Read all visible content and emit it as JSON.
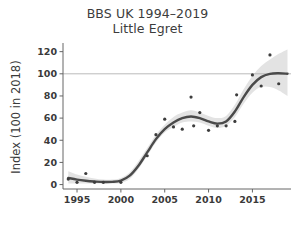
{
  "chart_data": {
    "type": "scatter",
    "title": "BBS UK 1994–2019",
    "subtitle": "Little Egret",
    "xlabel": "",
    "ylabel": "Index (100 in 2018)",
    "xlim": [
      1993.4,
      2019.4
    ],
    "ylim": [
      -4,
      126
    ],
    "xticks": [
      1995,
      2000,
      2005,
      2010,
      2015
    ],
    "xtick_labels": [
      "1995",
      "2000",
      "2005",
      "2010",
      "2015"
    ],
    "yticks": [
      0,
      20,
      40,
      60,
      80,
      100,
      120
    ],
    "ytick_labels": [
      "0",
      "20",
      "40",
      "60",
      "80",
      "100",
      "120"
    ],
    "grid": false,
    "reference_line": {
      "y": 100,
      "color": "#aaaaaa"
    },
    "legend": null,
    "series": [
      {
        "name": "annual index",
        "type": "scatter",
        "marker_color": "#3d3d3d",
        "points": [
          {
            "x": 1994,
            "y": 5
          },
          {
            "x": 1995,
            "y": 2
          },
          {
            "x": 1996,
            "y": 10
          },
          {
            "x": 1997,
            "y": 2
          },
          {
            "x": 1998,
            "y": 2
          },
          {
            "x": 2000,
            "y": 2
          },
          {
            "x": 2003,
            "y": 26
          },
          {
            "x": 2004,
            "y": 45
          },
          {
            "x": 2005,
            "y": 59
          },
          {
            "x": 2006,
            "y": 52
          },
          {
            "x": 2007,
            "y": 50
          },
          {
            "x": 2008,
            "y": 79
          },
          {
            "x": 2008.3,
            "y": 53
          },
          {
            "x": 2009,
            "y": 65
          },
          {
            "x": 2010,
            "y": 49
          },
          {
            "x": 2011,
            "y": 53
          },
          {
            "x": 2012,
            "y": 53
          },
          {
            "x": 2013,
            "y": 57
          },
          {
            "x": 2013.2,
            "y": 81
          },
          {
            "x": 2015,
            "y": 99
          },
          {
            "x": 2016,
            "y": 89
          },
          {
            "x": 2017,
            "y": 117
          },
          {
            "x": 2018,
            "y": 91
          }
        ]
      },
      {
        "name": "smoothed trend",
        "type": "line",
        "line_color": "#4a4a4a",
        "points": [
          {
            "x": 1994,
            "y": 6
          },
          {
            "x": 1995,
            "y": 4.5
          },
          {
            "x": 1996,
            "y": 3.5
          },
          {
            "x": 1997,
            "y": 2.8
          },
          {
            "x": 1998,
            "y": 2.3
          },
          {
            "x": 1999,
            "y": 2.4
          },
          {
            "x": 2000,
            "y": 3.5
          },
          {
            "x": 2001,
            "y": 8
          },
          {
            "x": 2002,
            "y": 17
          },
          {
            "x": 2003,
            "y": 29
          },
          {
            "x": 2004,
            "y": 41
          },
          {
            "x": 2005,
            "y": 50
          },
          {
            "x": 2006,
            "y": 56
          },
          {
            "x": 2007,
            "y": 60
          },
          {
            "x": 2008,
            "y": 61.5
          },
          {
            "x": 2009,
            "y": 60
          },
          {
            "x": 2010,
            "y": 57
          },
          {
            "x": 2011,
            "y": 55
          },
          {
            "x": 2012,
            "y": 57
          },
          {
            "x": 2013,
            "y": 66
          },
          {
            "x": 2014,
            "y": 79
          },
          {
            "x": 2015,
            "y": 90
          },
          {
            "x": 2016,
            "y": 97
          },
          {
            "x": 2017,
            "y": 100
          },
          {
            "x": 2018,
            "y": 100.5
          },
          {
            "x": 2019,
            "y": 100
          }
        ]
      },
      {
        "name": "confidence band",
        "type": "area",
        "fill_color": "#e2e2e2",
        "lower": [
          {
            "x": 1994,
            "y": 1
          },
          {
            "x": 1995,
            "y": 1
          },
          {
            "x": 1996,
            "y": 1
          },
          {
            "x": 1997,
            "y": 1
          },
          {
            "x": 1998,
            "y": 1
          },
          {
            "x": 1999,
            "y": 1
          },
          {
            "x": 2000,
            "y": 1.5
          },
          {
            "x": 2001,
            "y": 5
          },
          {
            "x": 2002,
            "y": 14
          },
          {
            "x": 2003,
            "y": 26
          },
          {
            "x": 2004,
            "y": 38
          },
          {
            "x": 2005,
            "y": 47
          },
          {
            "x": 2006,
            "y": 52
          },
          {
            "x": 2007,
            "y": 56
          },
          {
            "x": 2008,
            "y": 57
          },
          {
            "x": 2009,
            "y": 56
          },
          {
            "x": 2010,
            "y": 53
          },
          {
            "x": 2011,
            "y": 51
          },
          {
            "x": 2012,
            "y": 53
          },
          {
            "x": 2013,
            "y": 61
          },
          {
            "x": 2014,
            "y": 73
          },
          {
            "x": 2015,
            "y": 83
          },
          {
            "x": 2016,
            "y": 88
          },
          {
            "x": 2017,
            "y": 88
          },
          {
            "x": 2018,
            "y": 85
          },
          {
            "x": 2019,
            "y": 80
          }
        ],
        "upper": [
          {
            "x": 1994,
            "y": 12
          },
          {
            "x": 1995,
            "y": 9
          },
          {
            "x": 1996,
            "y": 7
          },
          {
            "x": 1997,
            "y": 5.5
          },
          {
            "x": 1998,
            "y": 4.5
          },
          {
            "x": 1999,
            "y": 4.5
          },
          {
            "x": 2000,
            "y": 6
          },
          {
            "x": 2001,
            "y": 11
          },
          {
            "x": 2002,
            "y": 21
          },
          {
            "x": 2003,
            "y": 33
          },
          {
            "x": 2004,
            "y": 45
          },
          {
            "x": 2005,
            "y": 54
          },
          {
            "x": 2006,
            "y": 61
          },
          {
            "x": 2007,
            "y": 65
          },
          {
            "x": 2008,
            "y": 67
          },
          {
            "x": 2009,
            "y": 65
          },
          {
            "x": 2010,
            "y": 62
          },
          {
            "x": 2011,
            "y": 60
          },
          {
            "x": 2012,
            "y": 62
          },
          {
            "x": 2013,
            "y": 72
          },
          {
            "x": 2014,
            "y": 86
          },
          {
            "x": 2015,
            "y": 98
          },
          {
            "x": 2016,
            "y": 107
          },
          {
            "x": 2017,
            "y": 113
          },
          {
            "x": 2018,
            "y": 118
          },
          {
            "x": 2019,
            "y": 122
          }
        ]
      }
    ]
  }
}
